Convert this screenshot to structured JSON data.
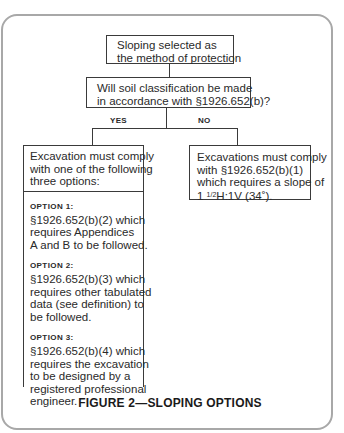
{
  "figure": {
    "caption": "FIGURE 2—SLOPING OPTIONS"
  },
  "nodes": {
    "start": {
      "lines": [
        "Sloping selected as",
        "the method of protection"
      ]
    },
    "question": {
      "lines": [
        "Will soil classification be made",
        "in accordance with §1926.652(b)?"
      ]
    },
    "yes_label": "YES",
    "no_label": "NO",
    "yes_branch": {
      "header_lines": [
        "Excavation must comply",
        "with one of the following",
        "three options:"
      ],
      "options": [
        {
          "title": "OPTION 1:",
          "lines": [
            "§1926.652(b)(2) which",
            "requires Appendices",
            "A and B to be followed."
          ]
        },
        {
          "title": "OPTION 2:",
          "lines": [
            "§1926.652(b)(3) which",
            "requires other tabulated",
            "data (see definition) to",
            "be followed."
          ]
        },
        {
          "title": "OPTION 3:",
          "lines": [
            "§1926.652(b)(4) which",
            "requires the excavation",
            "to be designed by a",
            "registered professional",
            "engineer."
          ]
        }
      ]
    },
    "no_branch": {
      "lines": [
        "Excavations must comply",
        "with §1926.652(b)(1)",
        "which requires a slope of"
      ],
      "slope_whole": "1 ",
      "slope_frac": "1/2",
      "slope_rest": "H:1V (34˚)."
    }
  }
}
